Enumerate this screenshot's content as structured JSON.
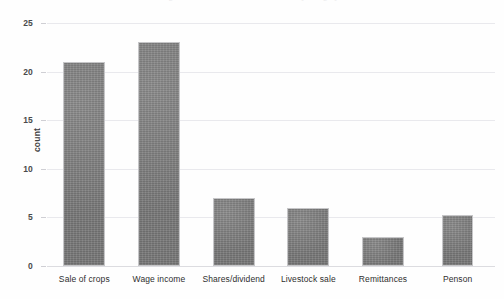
{
  "caption_remnant": "figures of household income sources by category",
  "chart_data": {
    "type": "bar",
    "title": "",
    "xlabel": "",
    "ylabel": "count",
    "categories": [
      "Sale of crops",
      "Wage income",
      "Shares/dividend",
      "Livestock sale",
      "Remittances",
      "Penson"
    ],
    "values": [
      21,
      23,
      7,
      6,
      3,
      5.2
    ],
    "ylim": [
      0,
      25
    ],
    "ytick_labels": [
      "0",
      "5",
      "10",
      "15",
      "20",
      "25"
    ],
    "ytick_values": [
      0,
      5,
      10,
      15,
      20,
      25
    ],
    "grid": true,
    "legend": "none",
    "bar_color": "#7d7d7d",
    "bar_border_color": "#c6c6c8",
    "gridline_color": "#e9e9ed",
    "axis_text_color": "#2e2e2e"
  }
}
